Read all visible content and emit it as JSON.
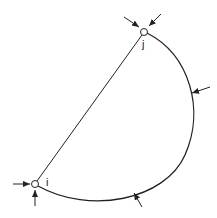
{
  "diagram": {
    "type": "structural member with curved and straight edges",
    "nodes": [
      {
        "id": "i",
        "label": "i",
        "x": 35,
        "y": 184
      },
      {
        "id": "j",
        "label": "j",
        "x": 144,
        "y": 32
      }
    ],
    "edges": [
      {
        "from": "i",
        "to": "j",
        "shape": "straight chord"
      },
      {
        "from": "j",
        "to": "i",
        "shape": "curved arc (clockwise)"
      }
    ],
    "arrows": [
      {
        "at": "j",
        "direction": "from upper-left"
      },
      {
        "at": "j",
        "direction": "from upper-right"
      },
      {
        "at": "arc-right",
        "direction": "from right"
      },
      {
        "at": "arc-bottom",
        "direction": "from below-right"
      },
      {
        "at": "i",
        "direction": "from left"
      },
      {
        "at": "i",
        "direction": "from below"
      }
    ],
    "colors": {
      "stroke": "#222222",
      "background": "#ffffff"
    }
  }
}
